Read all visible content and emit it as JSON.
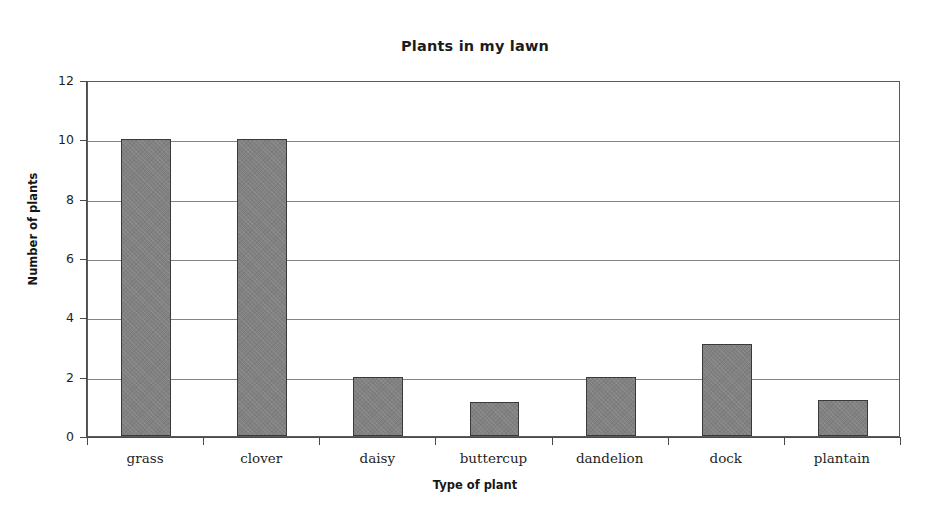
{
  "chart_data": {
    "type": "bar",
    "title": "Plants in my lawn",
    "xlabel": "Type of plant",
    "ylabel": "Number of plants",
    "categories": [
      "grass",
      "clover",
      "daisy",
      "buttercup",
      "dandelion",
      "dock",
      "plantain"
    ],
    "values": [
      10,
      10,
      2,
      1.15,
      2,
      3.1,
      1.2
    ],
    "ylim": [
      0,
      12
    ],
    "ytick_labels": [
      "0",
      "2",
      "4",
      "6",
      "8",
      "10",
      "12"
    ],
    "ytick_values": [
      0,
      2,
      4,
      6,
      8,
      10,
      12
    ],
    "grid": "horizontal",
    "legend": "none",
    "bar_color": "#818181",
    "bar_edge_color": "#3a3a3a",
    "gridline_color": "#6e6e6e",
    "axis_color": "#4a4a4a",
    "background_color": "#ffffff"
  }
}
